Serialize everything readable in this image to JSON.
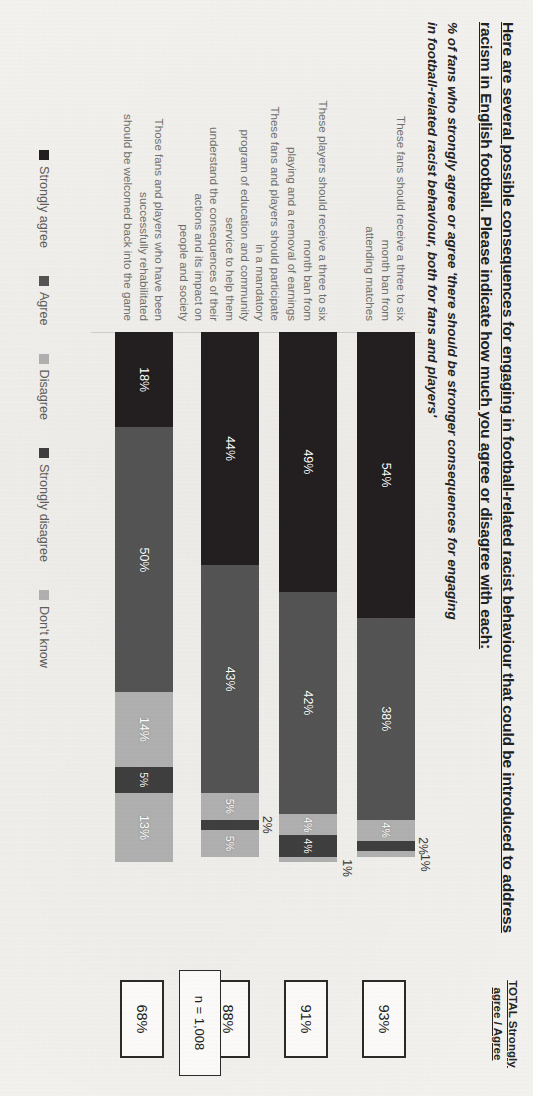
{
  "header": {
    "title_lines": [
      "Here are several possible consequences for engaging in football-related racist behaviour that could be introduced to address",
      "racism in English football.  Please indicate how much you agree or disagree with each:"
    ],
    "subtitle_lines": [
      "% of fans who strongly agree or agree 'there should be stronger consequences for engaging",
      "in football-related racist behaviour, both for fans and players'"
    ],
    "total_column_header_line1": "TOTAL Strongly",
    "total_column_header_line2": "agree / Agree",
    "sample_size": "n = 1,008"
  },
  "chart_data": {
    "type": "bar",
    "orientation": "horizontal-stacked",
    "subtitle": "% of fans who strongly agree or agree 'there should be stronger consequences for engaging in football-related racist behaviour, both for fans and players'",
    "xlabel": "",
    "ylabel": "",
    "xlim": [
      0,
      100
    ],
    "grid": false,
    "legend_position": "bottom",
    "stacked_percent": true,
    "categories": [
      "These fans should receive a three to six month ban from attending matches",
      "These players should receive a three to six month ban from playing and a removal of earnings",
      "These fans and players should participate in a mandatory program of education and community service to help them understand the consequences of their actions and its impact on people and society",
      "Those fans and players who have been successfully rehabilitated should be welcomed back into the game"
    ],
    "category_lines": [
      [
        "These fans should receive a three to six month ban from",
        "attending matches"
      ],
      [
        "These players should receive a three to six month ban from",
        "playing and a removal of earnings"
      ],
      [
        "These fans and players should participate in a mandatory",
        "program of education and community service to help them",
        "understand the consequences of their actions and its impact on",
        "people and society"
      ],
      [
        "Those fans and players who have been successfully rehabilitated",
        "should be welcomed back into the game"
      ]
    ],
    "series": [
      {
        "name": "Strongly agree",
        "color": "#231f20",
        "values": [
          54,
          49,
          44,
          18
        ],
        "labels": [
          "54%",
          "49%",
          "44%",
          "18%"
        ]
      },
      {
        "name": "Agree",
        "color": "#545454",
        "values": [
          38,
          42,
          43,
          50
        ],
        "labels": [
          "38%",
          "42%",
          "43%",
          "50%"
        ]
      },
      {
        "name": "Disagree",
        "color": "#b0b0b0",
        "values": [
          4,
          4,
          5,
          14
        ],
        "labels": [
          "4%",
          "4%",
          "5%",
          "14%"
        ]
      },
      {
        "name": "Strongly disagree",
        "color": "#3f3f3f",
        "values": [
          2,
          4,
          2,
          5
        ],
        "labels": [
          "2%",
          "4%",
          "2%",
          "5%"
        ]
      },
      {
        "name": "Don't know",
        "color": "#b0b0b0",
        "values": [
          1,
          1,
          5,
          13
        ],
        "labels": [
          "1%",
          "1%",
          "5%",
          "13%"
        ]
      }
    ],
    "totals": [
      "93%",
      "91%",
      "88%",
      "68%"
    ],
    "annotations": {
      "n": "n = 1,008"
    }
  },
  "legend": {
    "items": [
      {
        "label": "Strongly agree",
        "color": "#231f20"
      },
      {
        "label": "Agree",
        "color": "#545454"
      },
      {
        "label": "Disagree",
        "color": "#b0b0b0"
      },
      {
        "label": "Strongly disagree",
        "color": "#3f3f3f"
      },
      {
        "label": "Don't know",
        "color": "#b0b0b0"
      }
    ]
  }
}
